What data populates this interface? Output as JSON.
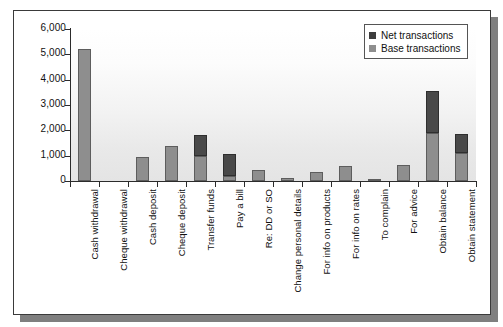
{
  "chart_data": {
    "type": "bar",
    "subtype": "stacked-bar",
    "title": "",
    "xlabel": "",
    "ylabel": "",
    "ylim": [
      0,
      6000
    ],
    "ytick_values": [
      0,
      1000,
      2000,
      3000,
      4000,
      5000,
      6000
    ],
    "ytick_labels": [
      "0",
      "1,000",
      "2,000",
      "3,000",
      "4,000",
      "5,000",
      "6,000"
    ],
    "grid": false,
    "legend_position": "top-right",
    "categories": [
      "Cash withdrawal",
      "Cheque withdrawal",
      "Cash deposit",
      "Cheque deposit",
      "Transfer funds",
      "Pay a bill",
      "Re: DD or SO",
      "Change personal details",
      "For info on products",
      "For info on rates",
      "To complain",
      "For advice",
      "Obtain balance",
      "Obtain statement"
    ],
    "series": [
      {
        "name": "Base transactions",
        "color": "#8e8e8e",
        "values": [
          5200,
          0,
          960,
          1370,
          990,
          200,
          440,
          120,
          360,
          600,
          70,
          620,
          1900,
          1110
        ]
      },
      {
        "name": "Net transactions",
        "color": "#494949",
        "values": [
          0,
          0,
          0,
          0,
          820,
          880,
          0,
          0,
          0,
          0,
          0,
          0,
          1670,
          760
        ]
      }
    ],
    "totals": [
      5200,
      0,
      960,
      1370,
      1810,
      1080,
      440,
      120,
      360,
      600,
      70,
      620,
      3570,
      1870
    ]
  },
  "legend": {
    "items": [
      {
        "label": "Net transactions",
        "swatch": "net-swatch-icon"
      },
      {
        "label": "Base transactions",
        "swatch": "base-swatch-icon"
      }
    ]
  },
  "colors": {
    "net": "#494949",
    "base": "#8e8e8e",
    "axis": "#2b2b2b",
    "frame_border": "#3a3a3a",
    "shadow": "#7f7f7f",
    "text": "#111111"
  }
}
